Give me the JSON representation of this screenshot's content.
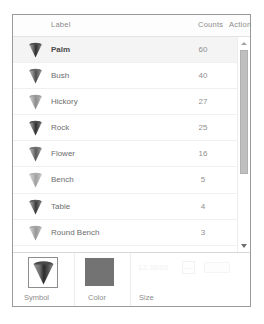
{
  "panel": {
    "name": "legend-editor-panel"
  },
  "table": {
    "headers": {
      "label": "Label",
      "counts": "Counts",
      "action": "Action"
    },
    "rows": [
      {
        "label": "Palm",
        "count": "60",
        "symbol": "cone-icon",
        "selected": true,
        "opacity": 1.0
      },
      {
        "label": "Bush",
        "count": "40",
        "symbol": "cone-icon",
        "selected": false,
        "opacity": 0.85
      },
      {
        "label": "Hickory",
        "count": "27",
        "symbol": "cone-icon",
        "selected": false,
        "opacity": 0.55
      },
      {
        "label": "Rock",
        "count": "25",
        "symbol": "cone-icon",
        "selected": false,
        "opacity": 1.0
      },
      {
        "label": "Flower",
        "count": "16",
        "symbol": "cone-icon",
        "selected": false,
        "opacity": 0.8
      },
      {
        "label": "Bench",
        "count": "5",
        "symbol": "cone-icon",
        "selected": false,
        "opacity": 0.45
      },
      {
        "label": "Table",
        "count": "4",
        "symbol": "cone-icon",
        "selected": false,
        "opacity": 0.95
      },
      {
        "label": "Round Bench",
        "count": "3",
        "symbol": "cone-icon",
        "selected": false,
        "opacity": 0.5
      }
    ]
  },
  "scrollbar": {
    "up_arrow": "triangle-up-icon",
    "down_arrow": "triangle-down-icon"
  },
  "editor": {
    "symbol_caption": "Symbol",
    "color_caption": "Color",
    "size_caption": "Size",
    "symbol_value": "cone-icon",
    "color_value": "#737373",
    "size_value": "12.0000"
  }
}
